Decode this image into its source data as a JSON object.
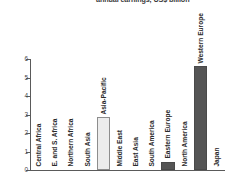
{
  "title": {
    "clipped_text": "annual earnings, US$ billion"
  },
  "chart_data": {
    "type": "bar",
    "title": "annual earnings, US$ billion",
    "xlabel": "",
    "ylabel": "",
    "ylim": [
      0,
      6
    ],
    "yticks": [
      0,
      1,
      2,
      3,
      4,
      5,
      6
    ],
    "ytick_labels": [
      "0",
      "1",
      "2",
      "3",
      "4",
      "5",
      "6"
    ],
    "grid": false,
    "legend": "none",
    "categories": [
      "Central Africa",
      "E. and S. Africa",
      "Northern Africa",
      "South Asia",
      "Asia-Pacific",
      "Middle East",
      "East Asia",
      "South America",
      "Eastern Europe",
      "North America",
      "Western Europe",
      "Japan"
    ],
    "values": [
      0,
      0,
      0,
      0,
      2.85,
      0,
      0,
      0,
      0.45,
      0,
      5.6,
      0
    ],
    "bar_styles": [
      "empty",
      "empty",
      "empty",
      "empty",
      "light",
      "empty",
      "empty",
      "empty",
      "dark",
      "empty",
      "dark",
      "empty"
    ]
  },
  "colors": {
    "light_bar": "#ececec",
    "light_bar_border": "#8d8d8d",
    "dark_bar": "#555555",
    "axis": "#5a5a5a",
    "text": "#231f20",
    "background": "#ffffff"
  }
}
